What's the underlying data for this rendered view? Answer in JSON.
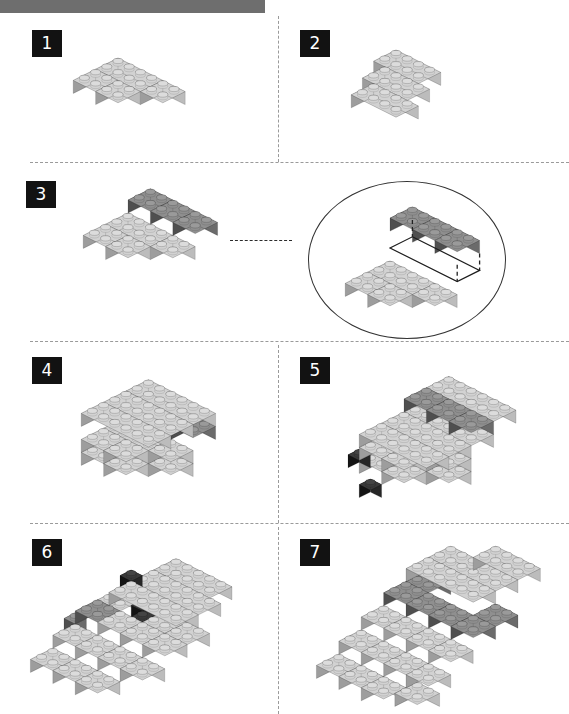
{
  "document": {
    "type": "lego-building-instructions",
    "page_background": "#ffffff",
    "header_bar_color": "#6e6e6e"
  },
  "palette": {
    "light_gray_top": "#d2d2d2",
    "light_gray_left": "#9d9d9d",
    "light_gray_right": "#bcbcbc",
    "light_gray_stud": "#dcdcdc",
    "mid_gray_top": "#b4b4b4",
    "mid_gray_left": "#8a8a8a",
    "mid_gray_right": "#a3a3a3",
    "dark_gray_top": "#8f8f8f",
    "dark_gray_left": "#4f4f4f",
    "dark_gray_right": "#6b6b6b",
    "dark_gray_stud": "#9a9a9a",
    "black_top": "#3a3a3a",
    "black_left": "#141414",
    "black_right": "#262626",
    "black_stud": "#444444",
    "badge_background": "#121212",
    "badge_text": "#ffffff",
    "separator": "#9a9a9a",
    "callout_outline": "#333333"
  },
  "steps": [
    {
      "number": "1",
      "caption": "Step 1",
      "brick_count": 4,
      "description": "Four bricks joined into an offset base plate"
    },
    {
      "number": "2",
      "caption": "Step 2",
      "brick_count": 3,
      "description": "Three 2x4 bricks placed in a staggered row"
    },
    {
      "number": "3",
      "caption": "Step 3",
      "brick_count": 7,
      "description": "Dark brick row added onto the light gray base",
      "has_callout": true,
      "callout_label": "detail-view"
    },
    {
      "number": "4",
      "caption": "Step 4",
      "brick_count": 10,
      "description": "Large light gray plate layer completed on top"
    },
    {
      "number": "5",
      "caption": "Step 5",
      "brick_count": 13,
      "description": "Dark gray row plus two small black bricks at the front"
    },
    {
      "number": "6",
      "caption": "Step 6",
      "brick_count": 17,
      "description": "Body widened with black accent bricks as eyes"
    },
    {
      "number": "7",
      "caption": "Step 7",
      "brick_count": 21,
      "description": "Dark gray shell layer covering the upper body"
    }
  ],
  "layout": {
    "columns": 2,
    "rows": 4,
    "separator_style": "dashed",
    "vertical_divider_x": 278,
    "horizontal_separator_y": [
      162,
      341,
      523
    ],
    "page_width": 569,
    "page_height": 714
  }
}
